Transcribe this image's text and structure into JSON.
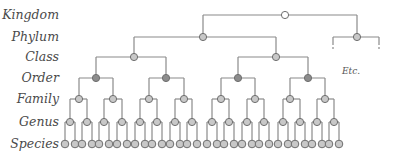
{
  "ranks": [
    {
      "label": "Kingdom",
      "y": 15
    },
    {
      "label": "Phylum",
      "y": 37
    },
    {
      "label": "Class",
      "y": 57
    },
    {
      "label": "Order",
      "y": 78
    },
    {
      "label": "Family",
      "y": 99
    },
    {
      "label": "Genus",
      "y": 122
    },
    {
      "label": "Species",
      "y": 144
    }
  ],
  "etc_label": "Etc.",
  "colors": {
    "line": "#8a8a8a",
    "kingdom_fill": "#ffffff",
    "node_fill": "#c8c8c8",
    "order_fill": "#8c8c8c",
    "node_stroke": "#6e6e6e",
    "label": "#4a4a4a"
  },
  "tree": {
    "kingdom": {
      "x": 285
    },
    "phylum": [
      {
        "x": 203
      },
      {
        "x": 357,
        "truncated": true,
        "bracket": [
          333,
          379
        ]
      }
    ],
    "class": [
      {
        "x": 134
      },
      {
        "x": 276
      }
    ],
    "order": [
      {
        "x": 96
      },
      {
        "x": 166
      },
      {
        "x": 238
      },
      {
        "x": 308
      }
    ],
    "family": [
      {
        "x": 79
      },
      {
        "x": 113
      },
      {
        "x": 149
      },
      {
        "x": 184
      },
      {
        "x": 221
      },
      {
        "x": 255
      },
      {
        "x": 290
      },
      {
        "x": 325
      }
    ],
    "genus": [
      {
        "x": 70
      },
      {
        "x": 87
      },
      {
        "x": 104
      },
      {
        "x": 122
      },
      {
        "x": 140
      },
      {
        "x": 157
      },
      {
        "x": 175
      },
      {
        "x": 192
      },
      {
        "x": 212
      },
      {
        "x": 229
      },
      {
        "x": 247
      },
      {
        "x": 264
      },
      {
        "x": 283
      },
      {
        "x": 300
      },
      {
        "x": 317
      },
      {
        "x": 334
      }
    ],
    "species_offset": 5
  }
}
